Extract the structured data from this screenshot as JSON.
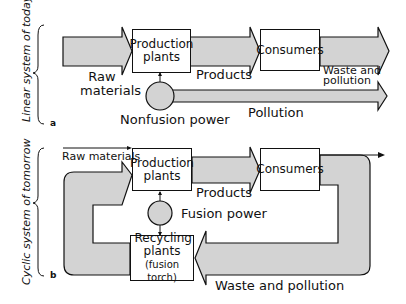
{
  "colors": {
    "arrow_fill": "#d3d3d3",
    "stroke": "#111111",
    "background": "#ffffff"
  },
  "panel_a": {
    "side_label": "Linear system of today",
    "tag": "a",
    "boxes": {
      "production": "Production plants",
      "consumers": "Consumers"
    },
    "power_source": "Nonfusion power",
    "flows": {
      "raw": "Raw materials",
      "products": "Products",
      "waste": "Waste and pollution",
      "pollution": "Pollution"
    }
  },
  "panel_b": {
    "side_label": "Cyclic system of tomorrow",
    "tag": "b",
    "boxes": {
      "production": "Production plants",
      "consumers": "Consumers",
      "recycling": "Recycling plants",
      "recycling_sub": "(fusion torch)"
    },
    "power_source": "Fusion power",
    "flows": {
      "raw": "Raw materials",
      "products": "Products",
      "waste": "Waste and pollution"
    }
  }
}
